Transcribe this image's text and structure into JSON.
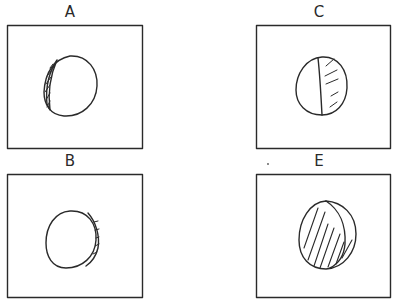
{
  "figure": {
    "panels": [
      {
        "id": "A",
        "label": "A",
        "shading": "thin crescent shaded on left edge",
        "position": "top-left"
      },
      {
        "id": "C",
        "label": "C",
        "shading": "right half shaded, vertical divider line",
        "position": "top-right"
      },
      {
        "id": "B",
        "label": "B",
        "shading": "thin crescent shaded on right edge",
        "position": "bottom-left"
      },
      {
        "id": "E",
        "label": "E",
        "shading": "fully shaded with diagonal hatching",
        "position": "bottom-right"
      }
    ],
    "stroke_color": "#2a2a2a",
    "background": "#ffffff"
  }
}
